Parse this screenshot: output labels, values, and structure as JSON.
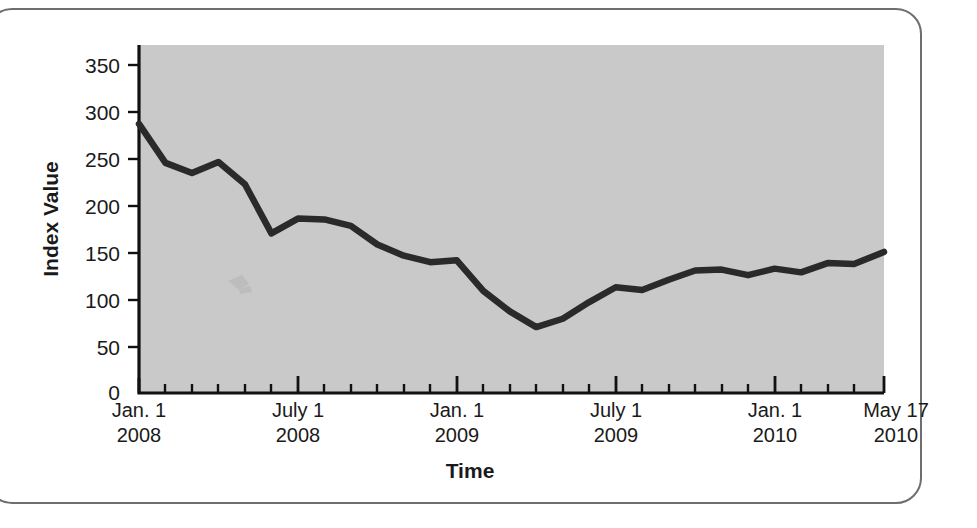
{
  "figure": {
    "border_color": "#6e6e6e",
    "background_color": "#ffffff",
    "plot_background_color": "#c9c9c9",
    "line_color": "#2a2a2a"
  },
  "chart_data": {
    "type": "line",
    "title": "",
    "subtitle": "",
    "xlabel": "Time",
    "ylabel": "Index Value",
    "ylim": [
      0,
      375
    ],
    "yticks": [
      0,
      50,
      100,
      150,
      200,
      250,
      300,
      350
    ],
    "ytick_labels": [
      "0",
      "50",
      "100",
      "150",
      "200",
      "250",
      "300",
      "350"
    ],
    "xlim": [
      "2008-01-01",
      "2010-05-17"
    ],
    "xtick_labels": [
      {
        "line1": "Jan. 1",
        "line2": "2008",
        "x": "2008-01-01"
      },
      {
        "line1": "July 1",
        "line2": "2008",
        "x": "2008-07-01"
      },
      {
        "line1": "Jan. 1",
        "line2": "2009",
        "x": "2009-01-01"
      },
      {
        "line1": "July 1",
        "line2": "2009",
        "x": "2009-07-01"
      },
      {
        "line1": "Jan. 1",
        "line2": "2010",
        "x": "2010-01-01"
      },
      {
        "line1": "May 17",
        "line2": "2010",
        "x": "2010-05-17"
      }
    ],
    "minor_tick_interval": "1 month",
    "major_tick_interval": "6 months",
    "grid": false,
    "legend": null,
    "legend_position": "none",
    "x": [
      "2008-01-01",
      "2008-02-01",
      "2008-03-01",
      "2008-04-01",
      "2008-05-01",
      "2008-06-01",
      "2008-07-01",
      "2008-08-01",
      "2008-09-01",
      "2008-10-01",
      "2008-11-01",
      "2008-12-01",
      "2009-01-01",
      "2009-02-01",
      "2009-03-01",
      "2009-04-01",
      "2009-05-01",
      "2009-06-01",
      "2009-07-01",
      "2009-08-01",
      "2009-09-01",
      "2009-10-01",
      "2009-11-01",
      "2009-12-01",
      "2010-01-01",
      "2010-02-01",
      "2010-03-01",
      "2010-04-01",
      "2010-05-17"
    ],
    "series": [
      {
        "name": "Index Value",
        "color": "#2a2a2a",
        "values": [
          290,
          248,
          237,
          249,
          225,
          172,
          188,
          187,
          180,
          160,
          148,
          141,
          143,
          110,
          88,
          71,
          80,
          98,
          114,
          111,
          122,
          132,
          133,
          127,
          134,
          130,
          140,
          139,
          152
        ]
      }
    ],
    "annotations": []
  }
}
